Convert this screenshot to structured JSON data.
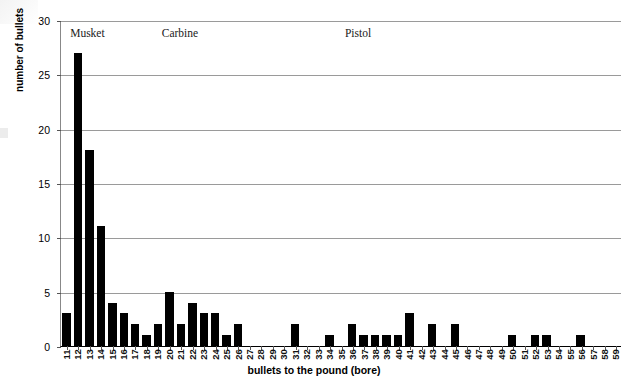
{
  "chart_data": {
    "type": "bar",
    "title": "",
    "xlabel": "bullets to the pound (bore)",
    "ylabel": "number of bullets",
    "ylim": [
      0,
      30
    ],
    "yticks": [
      0,
      5,
      10,
      15,
      20,
      25,
      30
    ],
    "grid": true,
    "legend": "none",
    "categories": [
      "11",
      "12",
      "13",
      "14",
      "15",
      "16",
      "17",
      "18",
      "19",
      "20",
      "21",
      "22",
      "23",
      "24",
      "25",
      "26",
      "27",
      "28",
      "29",
      "30",
      "31",
      "32",
      "33",
      "34",
      "35",
      "36",
      "37",
      "38",
      "39",
      "40",
      "41",
      "42",
      "43",
      "44",
      "45",
      "46",
      "47",
      "48",
      "49",
      "50",
      "51",
      "52",
      "53",
      "54",
      "55",
      "56",
      "57",
      "58",
      "59"
    ],
    "values": [
      3,
      27,
      18,
      11,
      4,
      3,
      2,
      1,
      2,
      5,
      2,
      4,
      3,
      3,
      1,
      2,
      0,
      0,
      0,
      0,
      2,
      0,
      0,
      1,
      0,
      2,
      1,
      1,
      1,
      1,
      3,
      0,
      2,
      0,
      2,
      0,
      0,
      0,
      0,
      1,
      0,
      1,
      1,
      0,
      0,
      1,
      0,
      0,
      0
    ],
    "bar_color": "#000000",
    "annotations": [
      {
        "text": "Musket",
        "x_category": "12"
      },
      {
        "text": "Carbine",
        "x_category": "20"
      },
      {
        "text": "Pistol",
        "x_category": "36"
      }
    ]
  }
}
